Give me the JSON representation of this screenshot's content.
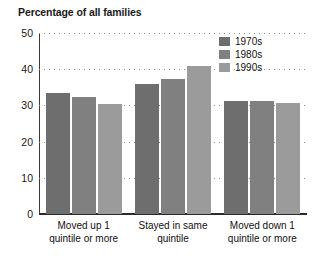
{
  "chart_data": {
    "type": "bar",
    "title": "Percentage of all families",
    "xlabel": "",
    "ylabel": "",
    "ylim": [
      0,
      50
    ],
    "yticks": [
      0,
      10,
      20,
      30,
      40,
      50
    ],
    "ytick_labels": [
      "0",
      "10",
      "20",
      "30",
      "40",
      "50"
    ],
    "grid": true,
    "grid_style": "dotted-horizontal",
    "legend_position": "top-right-inside",
    "categories": [
      "Moved up 1\nquintile or more",
      "Stayed in same\nquintile",
      "Moved down 1\nquintile or more"
    ],
    "category_lines": [
      [
        "Moved up 1",
        "quintile or more"
      ],
      [
        "Stayed in same",
        "quintile"
      ],
      [
        "Moved down 1",
        "quintile or more"
      ]
    ],
    "series": [
      {
        "name": "1970s",
        "color": "#6e6e6e",
        "values": [
          33.3,
          35.8,
          31.1
        ]
      },
      {
        "name": "1980s",
        "color": "#808080",
        "values": [
          32.2,
          37.2,
          31.1
        ]
      },
      {
        "name": "1990s",
        "color": "#9b9b9b",
        "values": [
          30.3,
          40.8,
          30.6
        ]
      }
    ]
  }
}
